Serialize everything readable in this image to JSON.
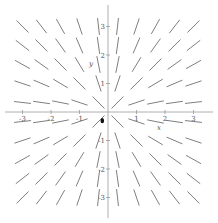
{
  "chart_data": {
    "type": "direction_field",
    "title": "",
    "equation_slope": "y/x",
    "xlabel": "x",
    "ylabel": "y",
    "xlim": [
      -3.5,
      3.5
    ],
    "ylim": [
      -3.5,
      3.5
    ],
    "x_ticks": [
      -3,
      -2,
      -1,
      1,
      2,
      3
    ],
    "y_ticks": [
      -3,
      -2,
      -1,
      1,
      2,
      3
    ],
    "x_tick_labels": [
      "-3",
      "-2",
      "-1",
      "1",
      "2",
      "3"
    ],
    "y_tick_labels": [
      "-3",
      "-2",
      "-1",
      "1",
      "2",
      "3"
    ],
    "grid": false,
    "grid_points_per_axis": 10,
    "grid_range": [
      -3.0,
      3.0
    ],
    "segment_color": "#707070",
    "axis_color": "#9a9a9a",
    "marker": {
      "x": -0.2,
      "y": -0.2,
      "color": "#111111"
    }
  }
}
